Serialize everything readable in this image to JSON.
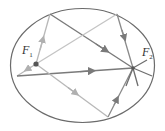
{
  "diagram": {
    "type": "ellipse-reflection",
    "ellipse": {
      "cx": 82.5,
      "cy": 65.5,
      "rx": 72,
      "ry": 57,
      "stroke": "#6b6b6b"
    },
    "foci": [
      {
        "id": "F1",
        "label": "F",
        "subscript": "1",
        "x": 36,
        "y": 64,
        "marker": "dot"
      },
      {
        "id": "F2",
        "label": "F",
        "subscript": "2",
        "x": 133,
        "y": 68,
        "marker": "convergence"
      }
    ],
    "reflection_points": [
      {
        "x": 50,
        "y": 14
      },
      {
        "x": 117,
        "y": 14
      },
      {
        "x": 17,
        "y": 76
      },
      {
        "x": 108,
        "y": 117
      }
    ],
    "colors": {
      "incident_ray": "#b8b8b8",
      "reflected_ray": "#7a7a7a",
      "focus_dot": "#555555",
      "ellipse": "#6b6b6b"
    }
  }
}
